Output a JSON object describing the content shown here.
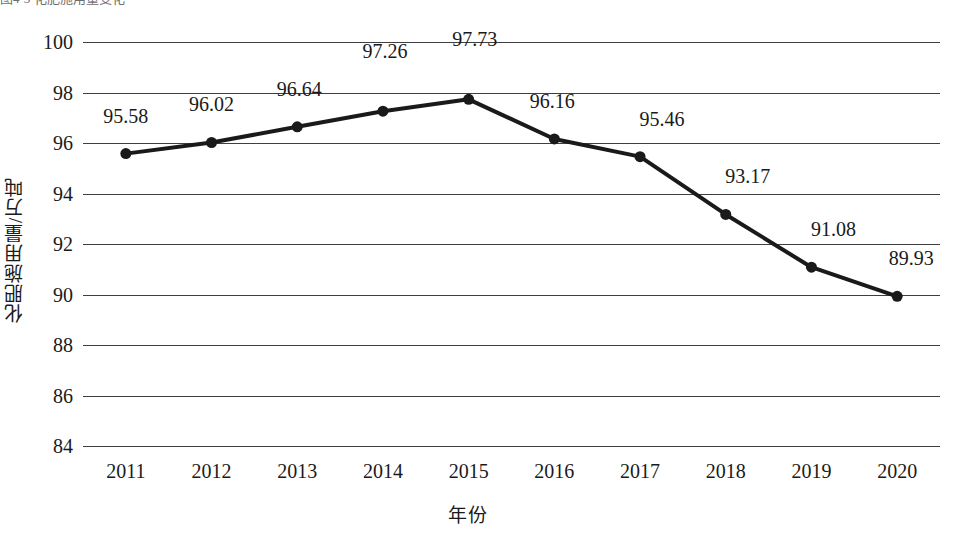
{
  "caption": {
    "text": "图4-3  化肥施用量变化"
  },
  "chart_data": {
    "type": "line",
    "title": "",
    "subtitle": "",
    "xlabel": "年份",
    "ylabel": "化肥施用量/万吨",
    "categories": [
      "2011",
      "2012",
      "2013",
      "2014",
      "2015",
      "2016",
      "2017",
      "2018",
      "2019",
      "2020"
    ],
    "values": [
      95.58,
      96.02,
      96.64,
      97.26,
      97.73,
      96.16,
      95.46,
      93.17,
      91.08,
      89.93
    ],
    "point_labels": [
      "95.58",
      "96.02",
      "96.64",
      "97.26",
      "97.73",
      "96.16",
      "95.46",
      "93.17",
      "91.08",
      "89.93"
    ],
    "label_offsets": [
      {
        "dx": 0,
        "dy": -26
      },
      {
        "dx": 0,
        "dy": -26
      },
      {
        "dx": 2,
        "dy": -26
      },
      {
        "dx": 2,
        "dy": -48
      },
      {
        "dx": 6,
        "dy": -48
      },
      {
        "dx": -2,
        "dy": -26
      },
      {
        "dx": 22,
        "dy": -26
      },
      {
        "dx": 22,
        "dy": -26
      },
      {
        "dx": 22,
        "dy": -26
      },
      {
        "dx": 14,
        "dy": -26
      }
    ],
    "ylim": [
      84,
      100
    ],
    "yticks": [
      84,
      86,
      88,
      90,
      92,
      94,
      96,
      98,
      100
    ],
    "ytick_labels": [
      "84",
      "86",
      "88",
      "90",
      "92",
      "94",
      "96",
      "98",
      "100"
    ],
    "grid": true,
    "grid_axis": "y",
    "legend": false,
    "legend_position": "none",
    "series_color": "#1a1a1a",
    "grid_color": "#3f3f3f",
    "marker": "circle",
    "marker_size": 11,
    "line_width": 4
  }
}
